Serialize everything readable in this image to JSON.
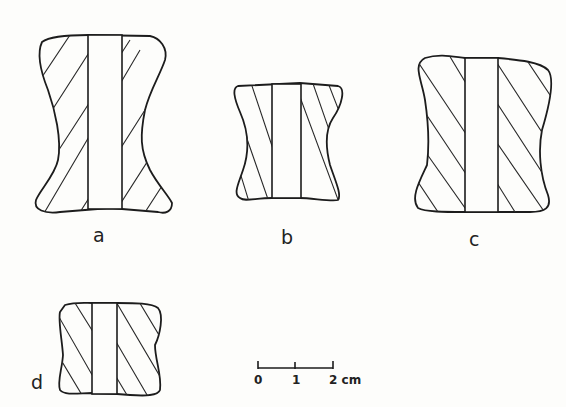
{
  "figure": {
    "objects": [
      {
        "id": "a",
        "label": "a"
      },
      {
        "id": "b",
        "label": "b"
      },
      {
        "id": "c",
        "label": "c"
      },
      {
        "id": "d",
        "label": "d"
      }
    ],
    "scale_bar": {
      "ticks": [
        "0",
        "1",
        "2 cm"
      ]
    }
  },
  "colors": {
    "ink": "#1c1c1c",
    "paper": "#fdfdfb"
  }
}
